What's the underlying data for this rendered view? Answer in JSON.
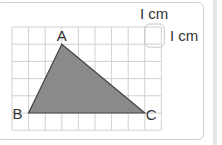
{
  "diagram": {
    "type": "triangle-on-grid",
    "grid": {
      "columns": 9,
      "rows": 6,
      "cell_unit": "1 cm",
      "line_color": "#d0d0d0"
    },
    "scale_labels": {
      "horizontal": "I cm",
      "vertical": "I cm"
    },
    "vertices": [
      {
        "label": "A",
        "col": 3,
        "row": 1
      },
      {
        "label": "B",
        "col": 1,
        "row": 5
      },
      {
        "label": "C",
        "col": 8,
        "row": 5
      }
    ],
    "fill_color": "#8a8a8a",
    "stroke_color": "#444444"
  }
}
